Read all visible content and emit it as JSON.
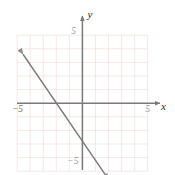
{
  "chart_data": {
    "type": "line",
    "title": "",
    "xlabel": "x",
    "ylabel": "y",
    "xlim": [
      -5,
      5
    ],
    "ylim": [
      -5,
      5
    ],
    "grid": true,
    "grid_step": 1,
    "legend": "none",
    "x_tick_labels": [
      {
        "value": -5,
        "text": "−5"
      },
      {
        "value": 5,
        "text": "5"
      }
    ],
    "y_tick_labels": [
      {
        "value": 5,
        "text": "5"
      },
      {
        "value": -5,
        "text": "−5"
      }
    ],
    "series": [
      {
        "name": "line",
        "kind": "line-segment-with-arrows",
        "slope": -1.1,
        "y_intercept": -1.4,
        "x_intercept": -1.3,
        "points": [
          {
            "x": -4.55,
            "y": 3.6
          },
          {
            "x": 2.0,
            "y": -5.6
          }
        ],
        "arrow_start": true,
        "arrow_end": true
      }
    ],
    "colors": {
      "grid": "#f0dede",
      "axis": "#7a7a7a",
      "line": "#7a7a7a",
      "text": "#2b2b2b",
      "background": "#ffffff"
    }
  },
  "annotations": {
    "x_axis_label": "x",
    "y_axis_label": "y",
    "tick_neg5_x": "−5",
    "tick_pos5_x": "5",
    "tick_pos5_y": "5",
    "tick_neg5_y": "−5"
  }
}
